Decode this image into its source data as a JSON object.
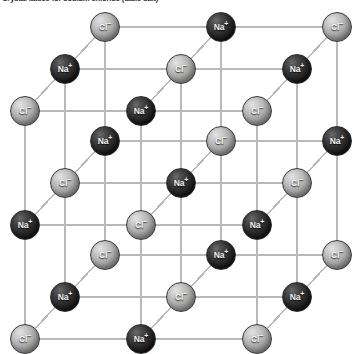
{
  "figure": {
    "title": "Crystal lattice for sodium chloride (table salt)",
    "background_color": "#ffffff",
    "bond_color": "#b9b9b9",
    "cation_color": "#1a1a1a",
    "anion_color": "#a9a9a9"
  },
  "species": {
    "na": {
      "key": "na",
      "label": "Na",
      "charge": "+",
      "name": "sodium-ion"
    },
    "cl": {
      "key": "cl",
      "label": "Cl",
      "charge": "−",
      "name": "chloride-ion"
    }
  },
  "lattice": {
    "type": "rock-salt",
    "dimensions": [
      3,
      3,
      3
    ],
    "projection": "oblique",
    "column_spacing": 116,
    "row_spacing": 114,
    "depth_offset_x": -40,
    "depth_offset_y": 42,
    "sphere_diameter": 30,
    "origin": [
      105,
      27
    ],
    "layers": [
      {
        "index": 0,
        "name": "back-layer",
        "rows": [
          [
            "cl",
            "na",
            "cl"
          ],
          [
            "na",
            "cl",
            "na"
          ],
          [
            "cl",
            "na",
            "cl"
          ]
        ]
      },
      {
        "index": 1,
        "name": "middle-layer",
        "rows": [
          [
            "na",
            "cl",
            "na"
          ],
          [
            "cl",
            "na",
            "cl"
          ],
          [
            "na",
            "cl",
            "na"
          ]
        ]
      },
      {
        "index": 2,
        "name": "front-layer",
        "rows": [
          [
            "cl",
            "na",
            "cl"
          ],
          [
            "na",
            "cl",
            "na"
          ],
          [
            "cl",
            "na",
            "cl"
          ]
        ]
      }
    ]
  }
}
